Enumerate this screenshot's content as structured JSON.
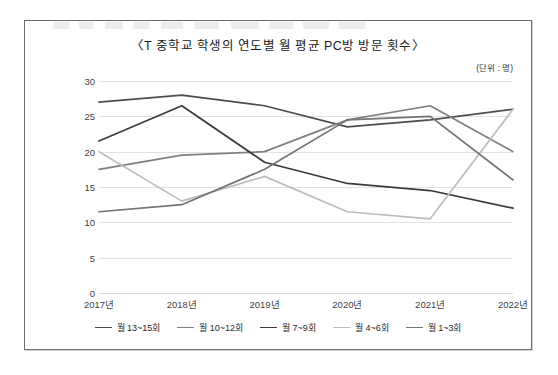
{
  "figure": {
    "title": "〈T 중학교 학생의 연도별 월 평균 PC방 방문 횟수〉",
    "unit_label": "(단위 : 명)"
  },
  "chart_data": {
    "type": "line",
    "title": "〈T 중학교 학생의 연도별 월 평균 PC방 방문 횟수〉",
    "subtitle": "(단위 : 명)",
    "xlabel": "",
    "ylabel": "",
    "categories": [
      "2017년",
      "2018년",
      "2019년",
      "2020년",
      "2021년",
      "2022년"
    ],
    "ylim": [
      0,
      30
    ],
    "yticks": [
      0,
      5,
      10,
      15,
      20,
      25,
      30
    ],
    "ytick_labels": [
      "0",
      "5",
      "10",
      "15",
      "20",
      "25",
      "30"
    ],
    "grid": true,
    "legend_position": "bottom",
    "series": [
      {
        "name": "월 13~15회",
        "color": "#4d4d4d",
        "values": [
          27.0,
          28.0,
          26.5,
          23.5,
          24.5,
          26.0
        ]
      },
      {
        "name": "월 10~12회",
        "color": "#808080",
        "values": [
          17.5,
          19.5,
          20.0,
          24.5,
          26.5,
          20.0
        ]
      },
      {
        "name": "월 7~9회",
        "color": "#3a3a3a",
        "values": [
          21.5,
          26.5,
          18.5,
          15.5,
          14.5,
          12.0
        ]
      },
      {
        "name": "월 4~6회",
        "color": "#bdbdbd",
        "values": [
          20.0,
          13.0,
          16.5,
          11.5,
          10.5,
          26.0
        ]
      },
      {
        "name": "월 1~3회",
        "color": "#737373",
        "values": [
          11.5,
          12.5,
          17.5,
          24.5,
          25.0,
          16.0
        ]
      }
    ]
  }
}
